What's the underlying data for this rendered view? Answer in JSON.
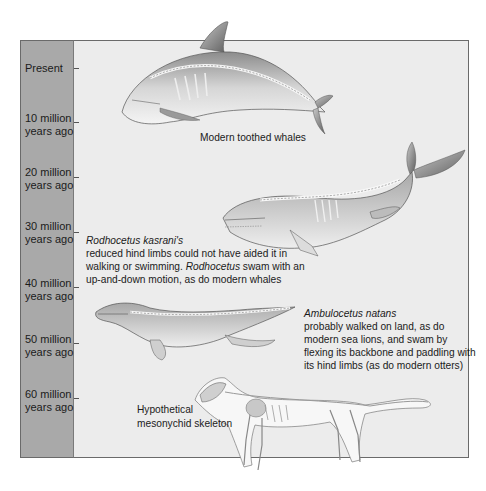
{
  "timeline": {
    "labels": [
      {
        "line1": "Present",
        "line2": ""
      },
      {
        "line1": "10 million",
        "line2": "years ago"
      },
      {
        "line1": "20 million",
        "line2": "years ago"
      },
      {
        "line1": "30 million",
        "line2": "years ago"
      },
      {
        "line1": "40 million",
        "line2": "years ago"
      },
      {
        "line1": "50 million",
        "line2": "years ago"
      },
      {
        "line1": "60 million",
        "line2": "years ago"
      }
    ]
  },
  "organisms": {
    "modern": {
      "caption": "Modern toothed whales",
      "illustration": "toothed-whale-skeleton"
    },
    "rodhocetus": {
      "name": "Rodhocetus kasrani's",
      "line1": "reduced hind limbs could not have aided it in",
      "line2a": "walking or swimming. ",
      "line2_italic": "Rodhocetus",
      "line2b": " swam with an",
      "line3": "up-and-down motion, as do modern whales",
      "illustration": "rodhocetus-skeleton"
    },
    "ambulocetus": {
      "name": "Ambulocetus natans",
      "line1": "probably walked on land, as do",
      "line2": "modern sea lions, and swam by",
      "line3": "flexing its backbone and paddling with",
      "line4": "its hind limbs (as do modern otters)",
      "illustration": "ambulocetus-skeleton"
    },
    "mesonychid": {
      "line1": "Hypothetical",
      "line2": "mesonychid skeleton",
      "illustration": "mesonychid-skeleton"
    }
  },
  "colors": {
    "timeline_bg": "#a9a9a9",
    "panel_bg": "#ececec",
    "border": "#6a6a6a"
  }
}
